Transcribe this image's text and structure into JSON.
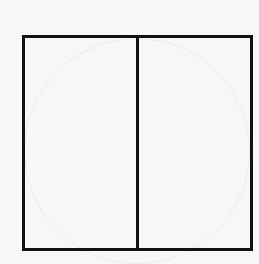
{
  "diagram": {
    "shape": "square",
    "divisions": 2,
    "division_orientation": "vertical",
    "parts": [
      {
        "id": "left-half",
        "shaded": false
      },
      {
        "id": "right-half",
        "shaded": false
      }
    ],
    "stroke_color": "#111111",
    "background_color": "#f7f7f7"
  }
}
